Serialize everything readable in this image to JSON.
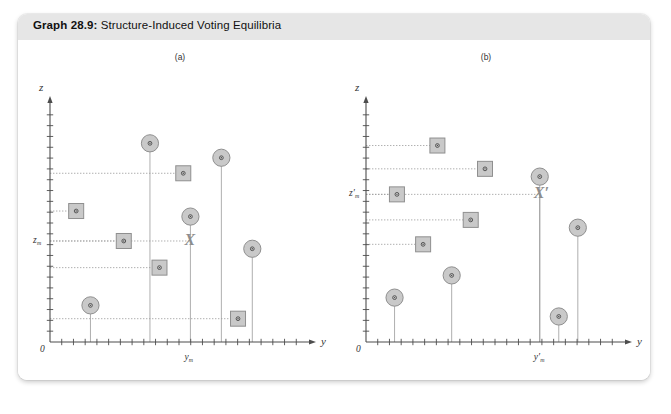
{
  "page": {
    "background": "#ffffff",
    "card_background": "#ffffff",
    "header_background": "#e6e6e6"
  },
  "header": {
    "lead": "Graph 28.9:",
    "title": " Structure-Induced Voting Equilibria"
  },
  "colors": {
    "axis": "#4d4d4d",
    "marker_fill": "#c9c9c9",
    "marker_stroke": "#8f8f8f",
    "marker_dot": "#4a4a4a",
    "guide_line": "#9a9a9a",
    "stem_line": "#9a9a9a",
    "x_marker": "#8d8d8d",
    "label": "#333333"
  },
  "chart_data": [
    {
      "type": "scatter",
      "id": "panel-a",
      "title": "(a)",
      "xlabel": "y",
      "ylabel": "z",
      "origin_label": "0",
      "xlim": [
        0,
        100
      ],
      "ylim": [
        0,
        100
      ],
      "grid": false,
      "legend": null,
      "axis_ticks": {
        "x_count": 21,
        "y_count": 21
      },
      "special_markers": [
        {
          "name": "X",
          "label": "X",
          "x": 59,
          "y": 45.5,
          "note": "status-quo point at (y_m, z_m)"
        }
      ],
      "reference_lines": [
        {
          "name": "z_m",
          "label": "z",
          "sub": "m",
          "axis": "y",
          "value": 45.5
        },
        {
          "name": "y_m",
          "label": "y",
          "sub": "m",
          "axis": "x",
          "value": 59
        }
      ],
      "series": [
        {
          "name": "circles",
          "marker": "circle",
          "points": [
            {
              "x": 42,
              "y": 89.5,
              "stem_to": 0
            },
            {
              "x": 72,
              "y": 83.0,
              "stem_to": 0
            },
            {
              "x": 59,
              "y": 56.5,
              "stem_to": 45.5
            },
            {
              "x": 85,
              "y": 42.0,
              "stem_to": 0
            },
            {
              "x": 17,
              "y": 16.5,
              "stem_to": 0
            }
          ]
        },
        {
          "name": "squares",
          "marker": "square",
          "points": [
            {
              "x": 56,
              "y": 76.0,
              "guide_to": 0
            },
            {
              "x": 11,
              "y": 59.0,
              "guide_to": 0
            },
            {
              "x": 31,
              "y": 45.5,
              "guide_to": 0
            },
            {
              "x": 46,
              "y": 33.5,
              "guide_to": 0
            },
            {
              "x": 79,
              "y": 10.5,
              "guide_to": 0
            }
          ]
        }
      ]
    },
    {
      "type": "scatter",
      "id": "panel-b",
      "title": "(b)",
      "xlabel": "y",
      "ylabel": "z",
      "origin_label": "0",
      "xlim": [
        0,
        100
      ],
      "ylim": [
        0,
        100
      ],
      "grid": false,
      "legend": null,
      "axis_ticks": {
        "x_count": 21,
        "y_count": 21
      },
      "special_markers": [
        {
          "name": "X-prime",
          "label": "X′",
          "x": 73,
          "y": 66.5,
          "note": "new status quo at (y′_m, z′_m)"
        }
      ],
      "reference_lines": [
        {
          "name": "z_m_prime",
          "label": "z′",
          "sub": "m",
          "axis": "y",
          "value": 66.5
        },
        {
          "name": "y_m_prime",
          "label": "y′",
          "sub": "m",
          "axis": "x",
          "value": 73
        }
      ],
      "series": [
        {
          "name": "circles",
          "marker": "circle",
          "points": [
            {
              "x": 73,
              "y": 74.5,
              "stem_to": 0
            },
            {
              "x": 89,
              "y": 51.5,
              "stem_to": 0
            },
            {
              "x": 36,
              "y": 30.0,
              "stem_to": 0
            },
            {
              "x": 12,
              "y": 20.0,
              "stem_to": 0
            },
            {
              "x": 81,
              "y": 11.5,
              "stem_to": 0
            }
          ]
        },
        {
          "name": "squares",
          "marker": "square",
          "points": [
            {
              "x": 30,
              "y": 88.5,
              "guide_to": 0
            },
            {
              "x": 50,
              "y": 78.0,
              "guide_to": 0
            },
            {
              "x": 13,
              "y": 66.5,
              "guide_to": 0
            },
            {
              "x": 44,
              "y": 55.0,
              "guide_to": 0
            },
            {
              "x": 24,
              "y": 44.0,
              "guide_to": 0
            }
          ]
        }
      ]
    }
  ]
}
